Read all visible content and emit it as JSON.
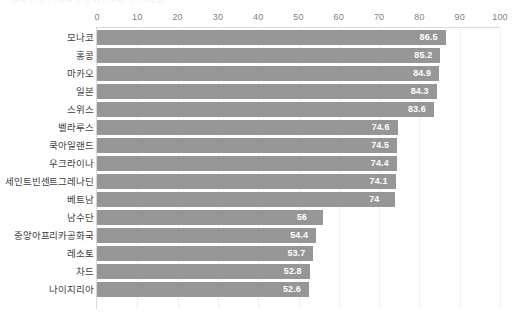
{
  "title_strip": {
    "text": "세계 각국 기대수명 상위 / 하위 국가 비교"
  },
  "chart_data": {
    "type": "bar",
    "orientation": "horizontal",
    "title": "",
    "xlabel": "",
    "ylabel": "",
    "xlim": [
      0,
      100
    ],
    "xticks": [
      0,
      10,
      20,
      30,
      40,
      50,
      60,
      70,
      80,
      90,
      100
    ],
    "xtick_labels": [
      "0",
      "10",
      "20",
      "30",
      "40",
      "50",
      "60",
      "70",
      "80",
      "90",
      "100"
    ],
    "grid": true,
    "legend": false,
    "bar_color": "#969696",
    "value_label_color": "#ffffff",
    "categories": [
      "모나코",
      "홍콩",
      "마카오",
      "일본",
      "스위스",
      "벨라루스",
      "쿡아일랜드",
      "우크라이나",
      "세인트빈센트그레나딘",
      "베트남",
      "남수단",
      "중앙아프리카공화국",
      "레소토",
      "차드",
      "나이지리아"
    ],
    "values": [
      86.5,
      85.2,
      84.9,
      84.3,
      83.6,
      74.6,
      74.5,
      74.4,
      74.1,
      74,
      56,
      54.4,
      53.7,
      52.8,
      52.6
    ],
    "value_labels": [
      "86.5",
      "85.2",
      "84.9",
      "84.3",
      "83.6",
      "74.6",
      "74.5",
      "74.4",
      "74.1",
      "74",
      "56",
      "54.4",
      "53.7",
      "52.8",
      "52.6"
    ]
  }
}
